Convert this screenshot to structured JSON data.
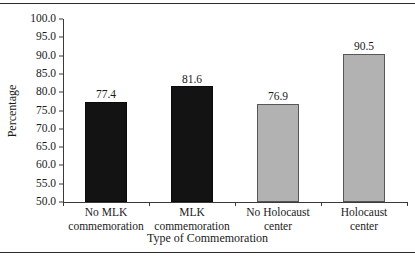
{
  "chart_data": {
    "type": "bar",
    "title": "",
    "subtitle": "",
    "xlabel": "Type of Commemoration",
    "ylabel": "Percentage",
    "categories": [
      "No MLK commemoration",
      "MLK commemoration",
      "No Holocaust center",
      "Holocaust center"
    ],
    "category_lines": [
      [
        "No MLK",
        "commemoration"
      ],
      [
        "MLK",
        "commemoration"
      ],
      [
        "No Holocaust",
        "center"
      ],
      [
        "Holocaust",
        "center"
      ]
    ],
    "values": [
      77.4,
      81.6,
      76.9,
      90.5
    ],
    "value_labels": [
      "77.4",
      "81.6",
      "76.9",
      "90.5"
    ],
    "bar_colors": [
      "#131313",
      "#131313",
      "#b2b2b2",
      "#b2b2b2"
    ],
    "ylim": [
      50.0,
      100.0
    ],
    "ytick_values": [
      100.0,
      95.0,
      90.0,
      85.0,
      80.0,
      75.0,
      70.0,
      65.0,
      60.0,
      55.0,
      50.0
    ],
    "ytick_labels": [
      "100.0",
      "95.0",
      "90.0",
      "85.0",
      "80.0",
      "75.0",
      "70.0",
      "65.0",
      "60.0",
      "55.0",
      "50.0"
    ],
    "grid": false,
    "legend": null,
    "legend_position": "none",
    "annotations": []
  },
  "colors": {
    "dark_bar": "#131313",
    "gray_bar": "#b2b2b2",
    "gray_bar_border": "#575757",
    "axis": "#3a3a3a",
    "text": "#1a1a1a",
    "rule": "#2b2b2b",
    "background": "#ffffff"
  }
}
